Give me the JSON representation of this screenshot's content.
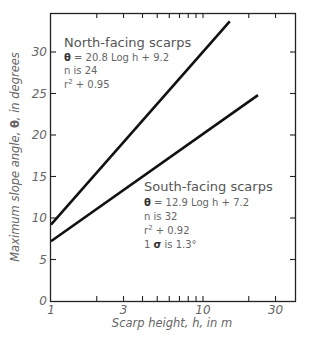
{
  "chart_data": {
    "type": "line",
    "title": "",
    "xlabel": "Scarp height, h, in m",
    "ylabel": "Maximum slope angle, θ, in degrees",
    "xscale": "log",
    "xlim": [
      1,
      40
    ],
    "ylim": [
      0,
      35
    ],
    "x_ticks": [
      1,
      3,
      10,
      30
    ],
    "x_tick_labels": [
      "1",
      "3",
      "10",
      "30"
    ],
    "x_minor_ticks": [
      2,
      4,
      5,
      6,
      7,
      8,
      9,
      20
    ],
    "y_ticks": [
      0,
      5,
      10,
      15,
      20,
      25,
      30
    ],
    "y_tick_labels": [
      "0",
      "5",
      "10",
      "15",
      "20",
      "25",
      "30"
    ],
    "grid": false,
    "series": [
      {
        "name": "North-facing scarps",
        "equation": "θ = 20.8 Log h + 9.2",
        "n": "n is 24",
        "r2": "r² + 0.95",
        "x": [
          1,
          15
        ],
        "y": [
          9.2,
          33.7
        ],
        "color": "#111111"
      },
      {
        "name": "South-facing scarps",
        "equation": "θ = 12.9 Log h + 7.2",
        "n": "n is 32",
        "r2": "r² + 0.92",
        "sigma": "1 σ is 1.3°",
        "x": [
          1,
          23
        ],
        "y": [
          7.2,
          24.8
        ],
        "color": "#111111"
      }
    ]
  },
  "annotations": {
    "north": {
      "title": "North-facing scarps",
      "eq_symbol": "θ",
      "eq_rest": " = 20.8 Log h + 9.2",
      "n": "n is 24",
      "r2_prefix": "r",
      "r2_sup": "2",
      "r2_rest": " + 0.95"
    },
    "south": {
      "title": "South-facing scarps",
      "eq_symbol": "θ",
      "eq_rest": " = 12.9 Log h + 7.2",
      "n": "n is 32",
      "r2_prefix": "r",
      "r2_sup": "2",
      "r2_rest": " + 0.92",
      "sigma_prefix": "1 ",
      "sigma_symbol": "σ",
      "sigma_rest": " is 1.3°"
    }
  },
  "axes": {
    "xlabel": "Scarp height, h, in m",
    "ylabel_prefix": "Maximum slope angle, ",
    "ylabel_symbol": "θ",
    "ylabel_suffix": ", in degrees"
  }
}
